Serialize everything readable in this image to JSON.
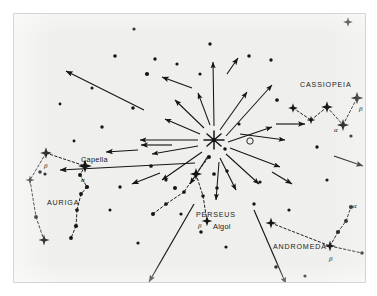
{
  "figure": {
    "kind": "star-chart",
    "background_color": "#efefed",
    "ink_color": "#151515",
    "panel": {
      "x": 14,
      "y": 14,
      "width": 351,
      "height": 268
    }
  },
  "chart_data": {
    "type": "scatter",
    "title": "",
    "xlabel": "",
    "ylabel": "",
    "grid": false,
    "legend_position": "none",
    "xlim": [
      0,
      351
    ],
    "ylim": [
      0,
      268
    ],
    "radiant": {
      "x": 200,
      "y": 126,
      "marker": "starburst"
    },
    "reference_circle": {
      "x": 236,
      "y": 127,
      "r": 3.2,
      "marker": "open-circle"
    },
    "constellations": [
      {
        "name": "CASSIOPEIA",
        "label_x": 286,
        "label_y": 68,
        "stars": [
          {
            "id": "c1",
            "x": 279,
            "y": 94,
            "mag": 2.6
          },
          {
            "id": "c2",
            "x": 297,
            "y": 106,
            "mag": 2.2
          },
          {
            "id": "c3",
            "x": 313,
            "y": 93,
            "mag": 3.4
          },
          {
            "id": "c4",
            "x": 329,
            "y": 111,
            "mag": 3.6,
            "greek": "α",
            "greek_dx": -9,
            "greek_dy": 2
          },
          {
            "id": "c5",
            "x": 343,
            "y": 84,
            "mag": 3.8,
            "greek": "β",
            "greek_dx": 2,
            "greek_dy": 8
          }
        ],
        "links": [
          [
            0,
            1
          ],
          [
            1,
            2
          ],
          [
            2,
            3
          ],
          [
            3,
            4
          ]
        ]
      },
      {
        "name": "AURIGA",
        "label_x": 33,
        "label_y": 186,
        "stars": [
          {
            "id": "a1",
            "x": 32,
            "y": 139,
            "mag": 3.4,
            "greek": "β",
            "greek_dx": -2,
            "greek_dy": 10
          },
          {
            "id": "a2",
            "x": 71,
            "y": 152,
            "mag": 4.2,
            "greek": "α",
            "greek_dx": -4,
            "greek_dy": 11,
            "name": "Capella",
            "name_dx": -4,
            "name_dy": -10
          },
          {
            "id": "a3",
            "x": 16,
            "y": 166,
            "mag": 2.4
          },
          {
            "id": "a4",
            "x": 26,
            "y": 158,
            "mag": 1.2
          },
          {
            "id": "a5",
            "x": 31,
            "y": 160,
            "mag": 1.0
          },
          {
            "id": "a6",
            "x": 22,
            "y": 203,
            "mag": 1.4
          },
          {
            "id": "a7",
            "x": 30,
            "y": 226,
            "mag": 3.2
          },
          {
            "id": "a8",
            "x": 66,
            "y": 161,
            "mag": 1.4
          },
          {
            "id": "a9",
            "x": 73,
            "y": 173,
            "mag": 1.6
          },
          {
            "id": "a10",
            "x": 67,
            "y": 180,
            "mag": 1.4
          },
          {
            "id": "a11",
            "x": 63,
            "y": 196,
            "mag": 1.3
          },
          {
            "id": "a12",
            "x": 62,
            "y": 212,
            "mag": 1.6
          },
          {
            "id": "a13",
            "x": 57,
            "y": 224,
            "mag": 1.4
          }
        ],
        "links": [
          [
            0,
            1
          ],
          [
            0,
            2
          ],
          [
            2,
            5
          ],
          [
            5,
            6
          ],
          [
            1,
            7
          ],
          [
            7,
            8
          ],
          [
            8,
            9
          ],
          [
            9,
            10
          ],
          [
            10,
            11
          ],
          [
            11,
            12
          ]
        ]
      },
      {
        "name": "PERSEUS",
        "label_x": 182,
        "label_y": 198,
        "stars": [
          {
            "id": "p1",
            "x": 182,
            "y": 160,
            "mag": 3.6
          },
          {
            "id": "p2",
            "x": 195,
            "y": 143,
            "mag": 1.4
          },
          {
            "id": "p3",
            "x": 170,
            "y": 178,
            "mag": 1.3
          },
          {
            "id": "p4",
            "x": 152,
            "y": 190,
            "mag": 1.3
          },
          {
            "id": "p5",
            "x": 139,
            "y": 200,
            "mag": 1.5
          },
          {
            "id": "p6",
            "x": 189,
            "y": 182,
            "mag": 1.2
          },
          {
            "id": "p7",
            "x": 193,
            "y": 207,
            "mag": 3.0,
            "greek": "β",
            "greek_dx": -9,
            "greek_dy": 2,
            "name": "Algol",
            "name_dx": 6,
            "name_dy": 2
          }
        ],
        "links": [
          [
            0,
            1
          ],
          [
            0,
            2
          ],
          [
            2,
            3
          ],
          [
            3,
            4
          ],
          [
            0,
            5
          ],
          [
            5,
            6
          ]
        ]
      },
      {
        "name": "ANDROMEDA",
        "label_x": 259,
        "label_y": 230,
        "stars": [
          {
            "id": "n1",
            "x": 257,
            "y": 209,
            "mag": 3.2
          },
          {
            "id": "n2",
            "x": 316,
            "y": 232,
            "mag": 3.2,
            "greek": "β",
            "greek_dx": -1,
            "greek_dy": 10
          },
          {
            "id": "n3",
            "x": 324,
            "y": 218,
            "mag": 1.6
          },
          {
            "id": "n4",
            "x": 332,
            "y": 207,
            "mag": 1.5
          },
          {
            "id": "n5",
            "x": 337,
            "y": 193,
            "mag": 1.6,
            "greek": "α",
            "greek_dx": 2,
            "greek_dy": -4
          },
          {
            "id": "n6",
            "x": 348,
            "y": 239,
            "mag": 1.2
          }
        ],
        "links": [
          [
            0,
            1
          ],
          [
            1,
            2
          ],
          [
            2,
            3
          ],
          [
            3,
            4
          ],
          [
            1,
            5
          ]
        ]
      }
    ],
    "field_stars": [
      {
        "x": 334,
        "y": 8,
        "mag": 2.6
      },
      {
        "x": 120,
        "y": 15,
        "mag": 1.0
      },
      {
        "x": 196,
        "y": 30,
        "mag": 1.1
      },
      {
        "x": 101,
        "y": 42,
        "mag": 1.2
      },
      {
        "x": 141,
        "y": 45,
        "mag": 1.1
      },
      {
        "x": 163,
        "y": 50,
        "mag": 1.0
      },
      {
        "x": 235,
        "y": 42,
        "mag": 1.2
      },
      {
        "x": 257,
        "y": 46,
        "mag": 1.1
      },
      {
        "x": 133,
        "y": 60,
        "mag": 1.6
      },
      {
        "x": 78,
        "y": 74,
        "mag": 0.9
      },
      {
        "x": 186,
        "y": 60,
        "mag": 1.0
      },
      {
        "x": 263,
        "y": 86,
        "mag": 1.3
      },
      {
        "x": 303,
        "y": 133,
        "mag": 1.1
      },
      {
        "x": 337,
        "y": 122,
        "mag": 1.0
      },
      {
        "x": 356,
        "y": 118,
        "mag": 1.1
      },
      {
        "x": 119,
        "y": 94,
        "mag": 1.2
      },
      {
        "x": 88,
        "y": 113,
        "mag": 1.1
      },
      {
        "x": 137,
        "y": 152,
        "mag": 1.3
      },
      {
        "x": 152,
        "y": 166,
        "mag": 1.0
      },
      {
        "x": 161,
        "y": 174,
        "mag": 1.5
      },
      {
        "x": 200,
        "y": 160,
        "mag": 1.3
      },
      {
        "x": 213,
        "y": 157,
        "mag": 1.1
      },
      {
        "x": 203,
        "y": 174,
        "mag": 1.2
      },
      {
        "x": 246,
        "y": 168,
        "mag": 1.0
      },
      {
        "x": 240,
        "y": 190,
        "mag": 1.1
      },
      {
        "x": 187,
        "y": 218,
        "mag": 1.2
      },
      {
        "x": 167,
        "y": 200,
        "mag": 1.0
      },
      {
        "x": 212,
        "y": 233,
        "mag": 1.0
      },
      {
        "x": 275,
        "y": 196,
        "mag": 1.0
      },
      {
        "x": 262,
        "y": 253,
        "mag": 1.2
      },
      {
        "x": 291,
        "y": 262,
        "mag": 1.0
      },
      {
        "x": 313,
        "y": 166,
        "mag": 1.0
      },
      {
        "x": 225,
        "y": 110,
        "mag": 1.0
      },
      {
        "x": 211,
        "y": 135,
        "mag": 1.2
      },
      {
        "x": 46,
        "y": 90,
        "mag": 0.8
      },
      {
        "x": 60,
        "y": 127,
        "mag": 0.8
      },
      {
        "x": 106,
        "y": 173,
        "mag": 1.1
      },
      {
        "x": 96,
        "y": 196,
        "mag": 0.9
      },
      {
        "x": 124,
        "y": 229,
        "mag": 1.0
      }
    ],
    "radiant_arrows": [
      {
        "x1": 200,
        "y1": 112,
        "x2": 199,
        "y2": 48,
        "len": 64
      },
      {
        "x1": 206,
        "y1": 116,
        "x2": 233,
        "y2": 78,
        "len": 47
      },
      {
        "x1": 212,
        "y1": 122,
        "x2": 258,
        "y2": 71,
        "len": 69
      },
      {
        "x1": 214,
        "y1": 128,
        "x2": 258,
        "y2": 113,
        "len": 47
      },
      {
        "x1": 216,
        "y1": 134,
        "x2": 266,
        "y2": 153,
        "len": 53
      },
      {
        "x1": 212,
        "y1": 140,
        "x2": 245,
        "y2": 170,
        "len": 44
      },
      {
        "x1": 206,
        "y1": 144,
        "x2": 222,
        "y2": 176,
        "len": 36
      },
      {
        "x1": 194,
        "y1": 142,
        "x2": 176,
        "y2": 170,
        "len": 34
      },
      {
        "x1": 188,
        "y1": 138,
        "x2": 148,
        "y2": 166,
        "len": 49
      },
      {
        "x1": 184,
        "y1": 132,
        "x2": 138,
        "y2": 140,
        "len": 47
      },
      {
        "x1": 184,
        "y1": 126,
        "x2": 126,
        "y2": 126,
        "len": 58
      },
      {
        "x1": 186,
        "y1": 120,
        "x2": 151,
        "y2": 105,
        "len": 38
      },
      {
        "x1": 190,
        "y1": 114,
        "x2": 161,
        "y2": 86,
        "len": 40
      },
      {
        "x1": 196,
        "y1": 111,
        "x2": 184,
        "y2": 79,
        "len": 34
      },
      {
        "x1": 205,
        "y1": 148,
        "x2": 202,
        "y2": 186,
        "len": 38
      },
      {
        "x1": 226,
        "y1": 120,
        "x2": 271,
        "y2": 126,
        "len": 45
      }
    ],
    "meteor_trails": [
      {
        "x1": 130,
        "y1": 96,
        "x2": 52,
        "y2": 57,
        "len": 87
      },
      {
        "x1": 178,
        "y1": 74,
        "x2": 148,
        "y2": 63,
        "len": 32
      },
      {
        "x1": 181,
        "y1": 149,
        "x2": 46,
        "y2": 156,
        "len": 135
      },
      {
        "x1": 124,
        "y1": 136,
        "x2": 92,
        "y2": 138,
        "len": 32
      },
      {
        "x1": 158,
        "y1": 131,
        "x2": 127,
        "y2": 131,
        "len": 31
      },
      {
        "x1": 146,
        "y1": 159,
        "x2": 118,
        "y2": 170,
        "len": 30
      },
      {
        "x1": 320,
        "y1": 142,
        "x2": 349,
        "y2": 152,
        "len": 31
      },
      {
        "x1": 180,
        "y1": 190,
        "x2": 135,
        "y2": 268,
        "len": 90
      },
      {
        "x1": 240,
        "y1": 196,
        "x2": 272,
        "y2": 270,
        "len": 80
      },
      {
        "x1": 262,
        "y1": 110,
        "x2": 291,
        "y2": 110,
        "len": 29
      },
      {
        "x1": 258,
        "y1": 158,
        "x2": 278,
        "y2": 170,
        "len": 24
      },
      {
        "x1": 213,
        "y1": 60,
        "x2": 224,
        "y2": 44,
        "len": 20
      }
    ]
  }
}
